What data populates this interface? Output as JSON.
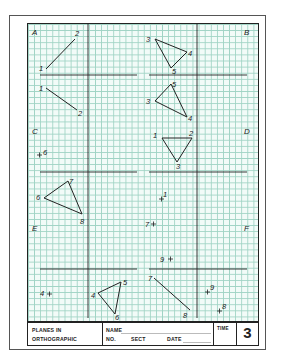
{
  "worksheet": {
    "topic": "Planes in orthographic",
    "sheet_number": "3",
    "problems": [
      {
        "label": "A",
        "points": [
          "1",
          "2"
        ],
        "description": "Line 1-2 in two views"
      },
      {
        "label": "B",
        "points": [
          "3",
          "4",
          "5"
        ],
        "description": "Triangle 3-4-5 in two views"
      },
      {
        "label": "C",
        "points": [
          "6",
          "7",
          "8"
        ],
        "description": "Point 6 and triangle 6-7-8"
      },
      {
        "label": "D",
        "points": [
          "1",
          "2",
          "3"
        ],
        "description": "Triangle 1-2-3 and point 1"
      },
      {
        "label": "E",
        "points": [
          "4",
          "5",
          "6"
        ],
        "description": "Point 4 and triangle 4-5-6"
      },
      {
        "label": "F",
        "points": [
          "7",
          "8",
          "9"
        ],
        "description": "Points 7, 9 and line 7-8, points 9, 8"
      }
    ]
  },
  "labels": {
    "A": "A",
    "B": "B",
    "C": "C",
    "D": "D",
    "E": "E",
    "F": "F",
    "p1": "1",
    "p2": "2",
    "p3": "3",
    "p4": "4",
    "p5": "5",
    "p6": "6",
    "p7": "7",
    "p8": "8",
    "p9": "9"
  },
  "title_block": {
    "planes_line1": "PLANES IN",
    "planes_line2": "ORTHOGRAPHIC",
    "name_label": "NAME",
    "no_label": "NO.",
    "sect_label": "SECT",
    "date_label": "DATE",
    "time_label": "TIME",
    "sheet_number": "3"
  },
  "colors": {
    "grid_line": "#9fd3c4",
    "grid_bg": "#f2fbf8",
    "ink": "#222222"
  }
}
